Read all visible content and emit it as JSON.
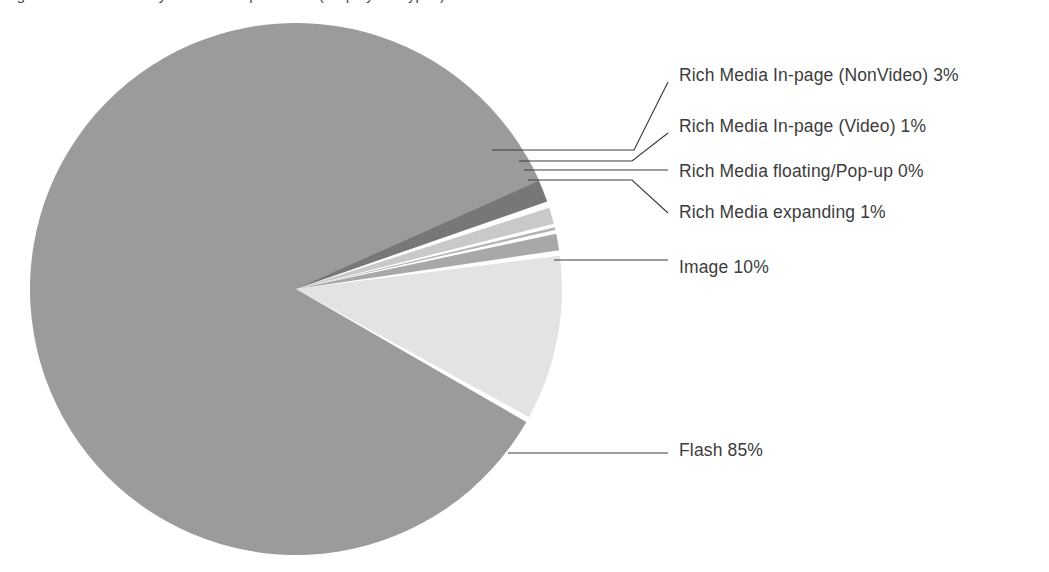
{
  "title": {
    "text": "Figure 3: Ad Formats by Share of Impressions (Display Ad Types)",
    "visible_fragment": true
  },
  "chart_data": {
    "type": "pie",
    "title": "",
    "legend_position": "callout-labels-right",
    "grid": false,
    "unit": "%",
    "categories": [
      "Rich Media In-page (NonVideo)",
      "Rich Media In-page (Video)",
      "Rich Media floating/Pop-up",
      "Rich Media expanding",
      "Image",
      "Flash"
    ],
    "values": [
      3,
      1,
      0,
      1,
      10,
      85
    ],
    "labels": [
      "Rich Media In-page (NonVideo) 3%",
      "Rich Media In-page (Video) 1%",
      "Rich Media floating/Pop-up 0%",
      "Rich Media expanding 1%",
      "Image 10%",
      "Flash 85%"
    ],
    "colors": [
      "#77777a",
      "#c9c9cb",
      "#b4b4b6",
      "#a8a8aa",
      "#e3e3e3",
      "#9b9b9d"
    ],
    "slices": [
      {
        "name": "Rich Media In-page (NonVideo)",
        "label": "Rich Media In-page (NonVideo) 3%",
        "value": 3,
        "color": "#77777a",
        "start_angle": -30.0,
        "end_angle": -19.2,
        "exploded": true
      },
      {
        "name": "Rich Media In-page (Video)",
        "label": "Rich Media In-page (Video) 1%",
        "value": 1,
        "color": "#c9c9cb",
        "start_angle": -17.8,
        "end_angle": -14.2,
        "exploded": true
      },
      {
        "name": "Rich Media floating/Pop-up",
        "label": "Rich Media floating/Pop-up 0%",
        "value": 0,
        "color": "#b4b4b6",
        "start_angle": -13.4,
        "end_angle": -12.8,
        "exploded": true
      },
      {
        "name": "Rich Media expanding",
        "label": "Rich Media expanding 1%",
        "value": 1,
        "color": "#a8a8aa",
        "start_angle": -12.0,
        "end_angle": -8.4,
        "exploded": true
      },
      {
        "name": "Image",
        "label": "Image 10%",
        "value": 10,
        "color": "#e3e3e3",
        "start_angle": -7.2,
        "end_angle": 28.8,
        "exploded": true
      },
      {
        "name": "Flash",
        "label": "Flash 85%",
        "value": 85,
        "color": "#9b9b9d",
        "start_angle": 30.0,
        "end_angle": 336.0,
        "exploded": false
      }
    ]
  },
  "callouts": [
    {
      "name": "callout-rich-media-inpage-nonvideo",
      "label": "Rich Media In-page (NonVideo) 3%",
      "text_x": 679,
      "text_y": 76
    },
    {
      "name": "callout-rich-media-inpage-video",
      "label": "Rich Media In-page (Video) 1%",
      "text_x": 679,
      "text_y": 127
    },
    {
      "name": "callout-rich-media-floating-popup",
      "label": "Rich Media floating/Pop-up 0%",
      "text_x": 679,
      "text_y": 172
    },
    {
      "name": "callout-rich-media-expanding",
      "label": "Rich Media expanding 1%",
      "text_x": 679,
      "text_y": 213
    },
    {
      "name": "callout-image",
      "label": "Image 10%",
      "text_x": 679,
      "text_y": 268
    },
    {
      "name": "callout-flash",
      "label": "Flash 85%",
      "text_x": 679,
      "text_y": 451
    }
  ],
  "geometry": {
    "center_x": 296,
    "center_y": 289,
    "radius": 266
  },
  "palette": {
    "background": "#ffffff",
    "text": "#3c3c3c",
    "leader_line": "#3c3c3c"
  }
}
